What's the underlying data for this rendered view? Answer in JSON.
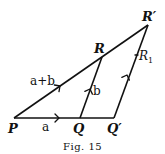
{
  "figure": {
    "caption": "Fig. 15",
    "points": {
      "P": {
        "label": "P",
        "x": 14,
        "y": 118
      },
      "Q": {
        "label": "Q",
        "x": 80,
        "y": 118
      },
      "Q_prime": {
        "label": "Q′",
        "x": 114,
        "y": 118
      },
      "R": {
        "label": "R",
        "x": 102,
        "y": 57
      },
      "R_prime": {
        "label": "R′",
        "x": 148,
        "y": 25
      }
    },
    "vectors": {
      "a": {
        "label": "a",
        "from": "P",
        "to": "Q"
      },
      "b": {
        "label": "b",
        "from": "Q",
        "to": "R"
      },
      "a_plus_b": {
        "label": "a+b",
        "from": "P",
        "to": "R_prime"
      },
      "R1": {
        "label": "R",
        "subscript": "1",
        "from": "Q_prime",
        "to": "R_prime"
      }
    }
  }
}
